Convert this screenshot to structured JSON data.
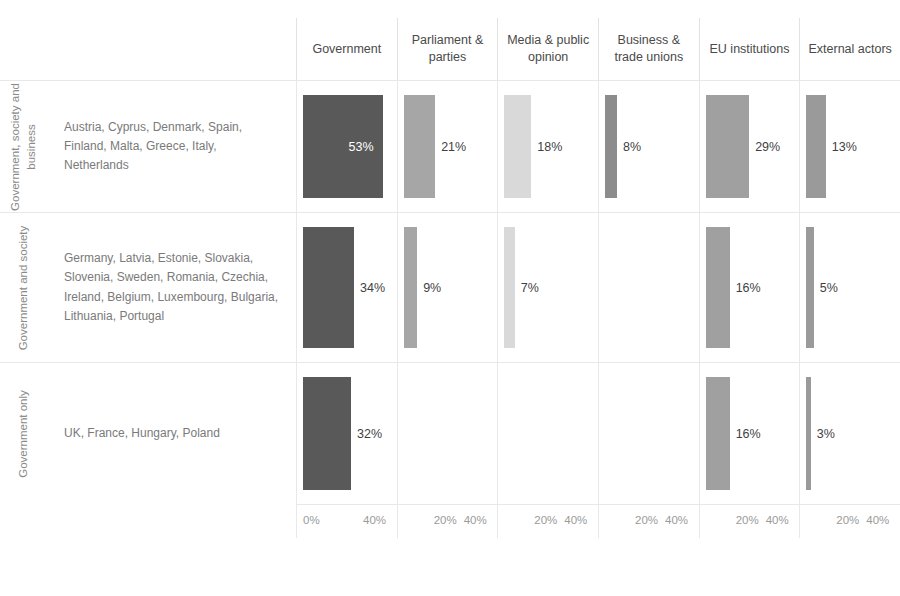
{
  "chart_data": {
    "type": "bar",
    "title": "",
    "subtitle": "",
    "xlabel": "",
    "ylabel": "",
    "layout": "small-multiples grid, 6 columns x 3 rows, horizontal bars",
    "grid": true,
    "legend": "none",
    "xlim": [
      0,
      60
    ],
    "axis_ticks": [
      {
        "labels": [
          "0%",
          "40%"
        ],
        "values": [
          0,
          40
        ]
      },
      {
        "labels": [
          "20%",
          "40%"
        ],
        "values": [
          20,
          40
        ]
      },
      {
        "labels": [
          "20%",
          "40%"
        ],
        "values": [
          20,
          40
        ]
      },
      {
        "labels": [
          "20%",
          "40%"
        ],
        "values": [
          20,
          40
        ]
      },
      {
        "labels": [
          "20%",
          "40%"
        ],
        "values": [
          20,
          40
        ]
      },
      {
        "labels": [
          "20%",
          "40%"
        ],
        "values": [
          20,
          40
        ]
      }
    ],
    "categories": [
      "Government",
      "Parliament & parties",
      "Media & public opinion",
      "Business & trade unions",
      "EU institutions",
      "External actors"
    ],
    "series": [
      {
        "name": "Government, society and business",
        "values": [
          53,
          21,
          18,
          8,
          29,
          13
        ]
      },
      {
        "name": "Government and society",
        "values": [
          34,
          9,
          7,
          null,
          16,
          5
        ]
      },
      {
        "name": "Government only",
        "values": [
          32,
          null,
          null,
          null,
          16,
          3
        ]
      }
    ],
    "colors": {
      "government": "#595959",
      "parliament": "#a6a6a6",
      "media": "#d9d9d9",
      "business": "#8c8c8c",
      "eu": "#a0a0a0",
      "external": "#9a9a9a",
      "gridline": "#e8e8e8",
      "label_text": "#3f3f3f",
      "inside_label_text": "#ffffff"
    }
  },
  "header": {
    "columns": [
      {
        "label": "Government"
      },
      {
        "label": "Parliament & parties"
      },
      {
        "label": "Media & public opinion"
      },
      {
        "label": "Business & trade unions"
      },
      {
        "label": "EU institutions"
      },
      {
        "label": "External actors"
      }
    ]
  },
  "rows": [
    {
      "cluster_label": "Government, society and business",
      "countries": "Austria, Cyprus, Denmark, Spain, Finland, Malta, Greece, Italy, Netherlands",
      "cells": [
        {
          "value_label": "53%",
          "pct": 53,
          "color": "#595959",
          "inside": true
        },
        {
          "value_label": "21%",
          "pct": 21,
          "color": "#a6a6a6",
          "inside": false
        },
        {
          "value_label": "18%",
          "pct": 18,
          "color": "#d9d9d9",
          "inside": false
        },
        {
          "value_label": "8%",
          "pct": 8,
          "color": "#8c8c8c",
          "inside": false
        },
        {
          "value_label": "29%",
          "pct": 29,
          "color": "#a0a0a0",
          "inside": false
        },
        {
          "value_label": "13%",
          "pct": 13,
          "color": "#9a9a9a",
          "inside": false
        }
      ]
    },
    {
      "cluster_label": "Government and society",
      "countries": "Germany, Latvia, Estonie, Slovakia, Slovenia, Sweden, Romania, Czechia, Ireland, Belgium, Luxembourg, Bulgaria, Lithuania, Portugal",
      "cells": [
        {
          "value_label": "34%",
          "pct": 34,
          "color": "#595959",
          "inside": false
        },
        {
          "value_label": "9%",
          "pct": 9,
          "color": "#a6a6a6",
          "inside": false
        },
        {
          "value_label": "7%",
          "pct": 7,
          "color": "#d9d9d9",
          "inside": false
        },
        {
          "value_label": "",
          "pct": 0,
          "color": "#8c8c8c",
          "inside": false
        },
        {
          "value_label": "16%",
          "pct": 16,
          "color": "#a0a0a0",
          "inside": false
        },
        {
          "value_label": "5%",
          "pct": 5,
          "color": "#9a9a9a",
          "inside": false
        }
      ]
    },
    {
      "cluster_label": "Government only",
      "countries": "UK, France, Hungary, Poland",
      "cells": [
        {
          "value_label": "32%",
          "pct": 32,
          "color": "#595959",
          "inside": false
        },
        {
          "value_label": "",
          "pct": 0,
          "color": "#a6a6a6",
          "inside": false
        },
        {
          "value_label": "",
          "pct": 0,
          "color": "#d9d9d9",
          "inside": false
        },
        {
          "value_label": "",
          "pct": 0,
          "color": "#8c8c8c",
          "inside": false
        },
        {
          "value_label": "16%",
          "pct": 16,
          "color": "#a0a0a0",
          "inside": false
        },
        {
          "value_label": "3%",
          "pct": 3,
          "color": "#9a9a9a",
          "inside": false
        }
      ]
    }
  ],
  "axis_row": [
    {
      "t1": "0%",
      "t2": "40%"
    },
    {
      "t1": "20%",
      "t2": "40%"
    },
    {
      "t1": "20%",
      "t2": "40%"
    },
    {
      "t1": "20%",
      "t2": "40%"
    },
    {
      "t1": "20%",
      "t2": "40%"
    },
    {
      "t1": "20%",
      "t2": "40%"
    }
  ]
}
